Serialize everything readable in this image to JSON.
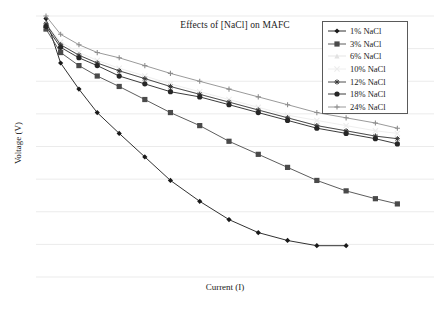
{
  "chart_data": {
    "type": "line",
    "title": "Effects of [NaCl] on MAFC",
    "xlabel": "Current (I)",
    "ylabel": "Voltage (V)",
    "grid": "horizontal",
    "legend_position": "top-right",
    "xlim": [
      0,
      100
    ],
    "ylim": [
      0,
      100
    ],
    "axis_ticks": "none",
    "x": [
      0,
      4,
      9,
      14,
      20,
      27,
      34,
      42,
      50,
      58,
      66,
      74,
      82,
      90,
      96
    ],
    "series": [
      {
        "name": "1% NaCl",
        "label": "1% NaCl",
        "color": "#1a1a1a",
        "marker": "diamond",
        "linestyle": "solid",
        "values": [
          99,
          82,
          72,
          63,
          55,
          46,
          37,
          29,
          22,
          17,
          14,
          12,
          12,
          null,
          null
        ]
      },
      {
        "name": "3% NaCl",
        "label": "3% NaCl",
        "color": "#4a4a4a",
        "marker": "square",
        "linestyle": "solid",
        "values": [
          95,
          86,
          81,
          77,
          73,
          68,
          63,
          58,
          52,
          47,
          42,
          37,
          33,
          30,
          28
        ]
      },
      {
        "name": "6% NaCl",
        "label": "6% NaCl",
        "color": "#e2e2e2",
        "marker": "triangle",
        "linestyle": "solid",
        "values": [
          96,
          89,
          85,
          82,
          79,
          76,
          73,
          70,
          67,
          64,
          61,
          58,
          56,
          54,
          53
        ]
      },
      {
        "name": "10% NaCl",
        "label": "10% NaCl",
        "color": "#ececec",
        "marker": "cross",
        "linestyle": "solid",
        "values": [
          97,
          90,
          86,
          83,
          80,
          77,
          74,
          71,
          68,
          65,
          62,
          60,
          58,
          56,
          55
        ]
      },
      {
        "name": "12% NaCl",
        "label": "12% NaCl",
        "color": "#3a3a3a",
        "marker": "star",
        "linestyle": "solid",
        "values": [
          97,
          89,
          85,
          82,
          79,
          76,
          73,
          70,
          67,
          64,
          61,
          58,
          56,
          54,
          53
        ]
      },
      {
        "name": "18% NaCl",
        "label": "18% NaCl",
        "color": "#262626",
        "marker": "circle",
        "linestyle": "solid",
        "values": [
          96,
          88,
          84,
          81,
          77,
          74,
          71,
          69,
          66,
          63,
          60,
          57,
          55,
          53,
          51
        ]
      },
      {
        "name": "24% NaCl",
        "label": "24% NaCl",
        "color": "#8e8e8e",
        "marker": "plus",
        "linestyle": "solid",
        "values": [
          100,
          93,
          89,
          86,
          84,
          81,
          78,
          75,
          72,
          69,
          66,
          63,
          61,
          59,
          57
        ]
      }
    ],
    "gridlines_y": [
      0,
      12.5,
      25,
      37.5,
      50,
      62.5,
      75,
      87.5,
      100
    ]
  }
}
